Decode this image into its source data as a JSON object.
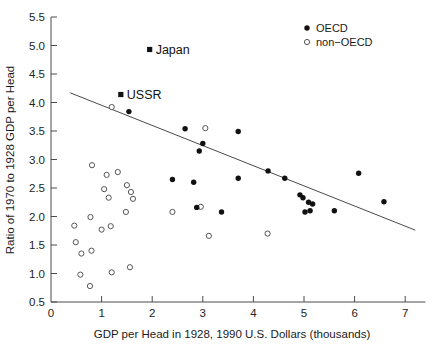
{
  "chart_data": {
    "type": "scatter",
    "title": "",
    "xlabel": "GDP per Head in 1928, 1990 U.S. Dollars (thousands)",
    "ylabel": "Ratio of 1970 to 1928 GDP per Head",
    "xlim": [
      0,
      7.4
    ],
    "ylim": [
      0.5,
      5.5
    ],
    "xticks": [
      0,
      1,
      2,
      3,
      4,
      5,
      6,
      7
    ],
    "xtick_labels": [
      "0",
      "1",
      "2",
      "3",
      "4",
      "5",
      "6",
      "7"
    ],
    "yticks": [
      0.5,
      1.0,
      1.5,
      2.0,
      2.5,
      3.0,
      3.5,
      4.0,
      4.5,
      5.0,
      5.5
    ],
    "ytick_labels": [
      "0.5",
      "1.0",
      "1.5",
      "2.0",
      "2.5",
      "3.0",
      "3.5",
      "4.0",
      "4.5",
      "5.0",
      "5.5"
    ],
    "grid": false,
    "legend_position": "top-right",
    "legend": [
      {
        "label": "OECD",
        "marker": "filled-circle",
        "color": "#111111"
      },
      {
        "label": "non−OECD",
        "marker": "open-circle",
        "color": "#555555"
      }
    ],
    "annotations": [
      {
        "label": "Japan",
        "x": 1.95,
        "y": 4.93,
        "marker": "filled-square"
      },
      {
        "label": "USSR",
        "x": 1.38,
        "y": 4.14,
        "marker": "filled-square"
      }
    ],
    "fit_line": {
      "x": [
        0.38,
        7.2
      ],
      "y": [
        4.17,
        1.76
      ],
      "style": "solid",
      "color": "#4a4a4a"
    },
    "series": [
      {
        "name": "OECD",
        "marker": "filled-circle",
        "color": "#111111",
        "points": [
          [
            1.54,
            3.84
          ],
          [
            2.65,
            3.54
          ],
          [
            3.0,
            3.28
          ],
          [
            2.93,
            3.15
          ],
          [
            3.7,
            3.49
          ],
          [
            2.4,
            2.65
          ],
          [
            2.82,
            2.6
          ],
          [
            3.37,
            2.08
          ],
          [
            3.7,
            2.67
          ],
          [
            4.29,
            2.8
          ],
          [
            4.62,
            2.67
          ],
          [
            4.92,
            2.38
          ],
          [
            4.98,
            2.33
          ],
          [
            5.09,
            2.25
          ],
          [
            5.17,
            2.22
          ],
          [
            5.02,
            2.08
          ],
          [
            5.12,
            2.1
          ],
          [
            5.6,
            2.1
          ],
          [
            6.08,
            2.76
          ],
          [
            6.58,
            2.26
          ],
          [
            2.88,
            2.16
          ]
        ]
      },
      {
        "name": "non−OECD",
        "marker": "open-circle",
        "color": "#555555",
        "points": [
          [
            1.2,
            3.92
          ],
          [
            0.81,
            2.9
          ],
          [
            1.1,
            2.73
          ],
          [
            1.32,
            2.78
          ],
          [
            1.05,
            2.48
          ],
          [
            1.5,
            2.55
          ],
          [
            1.14,
            2.33
          ],
          [
            1.58,
            2.43
          ],
          [
            1.62,
            2.31
          ],
          [
            1.48,
            2.08
          ],
          [
            0.78,
            1.99
          ],
          [
            0.46,
            1.84
          ],
          [
            1.0,
            1.77
          ],
          [
            1.18,
            1.83
          ],
          [
            0.49,
            1.55
          ],
          [
            0.6,
            1.35
          ],
          [
            0.8,
            1.4
          ],
          [
            0.58,
            0.98
          ],
          [
            1.2,
            1.02
          ],
          [
            1.56,
            1.11
          ],
          [
            0.77,
            0.78
          ],
          [
            2.4,
            2.08
          ],
          [
            2.96,
            2.17
          ],
          [
            3.12,
            1.66
          ],
          [
            4.28,
            1.7
          ],
          [
            3.05,
            3.55
          ]
        ]
      }
    ]
  },
  "axis": {
    "x_title": "GDP per Head in 1928, 1990 U.S. Dollars (thousands)",
    "y_title": "Ratio of 1970 to 1928 GDP per Head"
  }
}
